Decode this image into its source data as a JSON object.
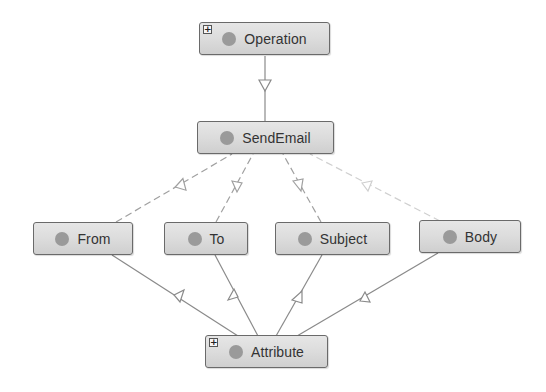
{
  "diagram": {
    "type": "class-hierarchy",
    "nodes": {
      "operation": {
        "label": "Operation",
        "expandable": true,
        "expander_glyph": "+"
      },
      "sendemail": {
        "label": "SendEmail",
        "expandable": false
      },
      "from": {
        "label": "From",
        "expandable": false
      },
      "to": {
        "label": "To",
        "expandable": false
      },
      "subject": {
        "label": "Subject",
        "expandable": false
      },
      "body": {
        "label": "Body",
        "expandable": false
      },
      "attribute": {
        "label": "Attribute",
        "expandable": true,
        "expander_glyph": "+"
      }
    },
    "edges": [
      {
        "from": "SendEmail",
        "to": "Operation",
        "style": "solid",
        "arrow": "hollow-triangle"
      },
      {
        "from": "From",
        "to": "SendEmail",
        "style": "dashed",
        "arrow": "hollow-triangle"
      },
      {
        "from": "To",
        "to": "SendEmail",
        "style": "dashed",
        "arrow": "hollow-triangle"
      },
      {
        "from": "Subject",
        "to": "SendEmail",
        "style": "dashed",
        "arrow": "hollow-triangle"
      },
      {
        "from": "Body",
        "to": "SendEmail",
        "style": "dashed-faint",
        "arrow": "hollow-triangle"
      },
      {
        "from": "Attribute",
        "to": "From",
        "style": "solid",
        "arrow": "hollow-triangle"
      },
      {
        "from": "Attribute",
        "to": "To",
        "style": "solid",
        "arrow": "hollow-triangle"
      },
      {
        "from": "Attribute",
        "to": "Subject",
        "style": "solid",
        "arrow": "hollow-triangle"
      },
      {
        "from": "Attribute",
        "to": "Body",
        "style": "solid",
        "arrow": "hollow-triangle"
      }
    ],
    "colors": {
      "node_fill_top": "#e6e6e6",
      "node_fill_bottom": "#cfcfcf",
      "node_border": "#6a6a6a",
      "dot": "#9a9a9a",
      "edge_solid": "#8a8a8a",
      "edge_dashed": "#a0a0a0",
      "edge_faint": "#cfcfcf"
    }
  }
}
